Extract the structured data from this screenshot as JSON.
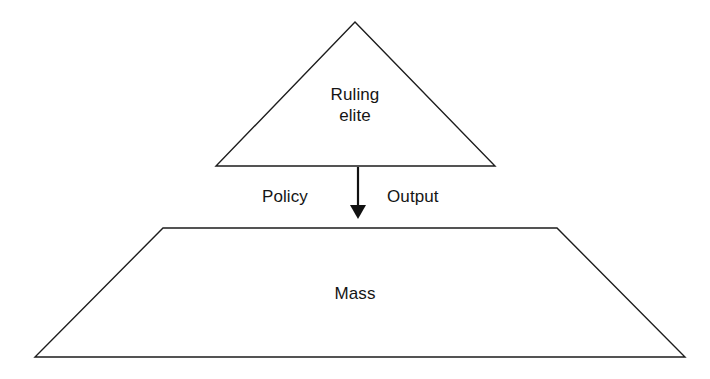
{
  "diagram": {
    "background_color": "#ffffff",
    "stroke_color": "#1d1d1d",
    "text_color": "#151515",
    "shapes": {
      "triangle": {
        "name": "Ruling elite",
        "label_line_1": "Ruling",
        "label_line_2": "elite",
        "apex": [
          355,
          22
        ],
        "base_left": [
          216,
          166
        ],
        "base_right": [
          495,
          166
        ]
      },
      "trapezoid": {
        "name": "Mass",
        "label": "Mass",
        "top_left": [
          163,
          228
        ],
        "top_right": [
          557,
          228
        ],
        "bottom_right": [
          685,
          357
        ],
        "bottom_left": [
          35,
          357
        ]
      }
    },
    "connector": {
      "name": "downward-arrow",
      "direction": "down",
      "from": [
        358,
        167
      ],
      "to": [
        358,
        219
      ],
      "left_label": "Policy",
      "right_label": "Output"
    }
  }
}
